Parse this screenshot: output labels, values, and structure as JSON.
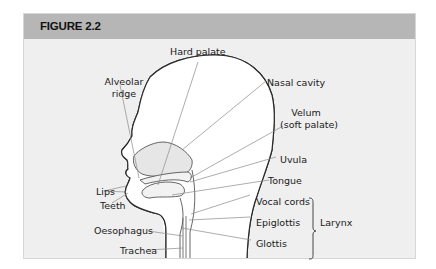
{
  "figure": {
    "title": "FIGURE 2.2",
    "colors": {
      "header": "#b6b6b6",
      "panel": "#efefef",
      "outline": "#2a2a2a",
      "leader": "#8a8a8a"
    }
  },
  "labels": {
    "hard_palate": "Hard palate",
    "alveolar_ridge_1": "Alveolar",
    "alveolar_ridge_2": "ridge",
    "nasal_cavity": "Nasal cavity",
    "velum_1": "Velum",
    "velum_2": "(soft palate)",
    "uvula": "Uvula",
    "tongue": "Tongue",
    "lips": "Lips",
    "teeth": "Teeth",
    "vocal_cords": "Vocal cords",
    "epiglottis": "Epiglottis",
    "glottis": "Glottis",
    "oesophagus": "Oesophagus",
    "trachea": "Trachea",
    "larynx": "Larynx"
  }
}
